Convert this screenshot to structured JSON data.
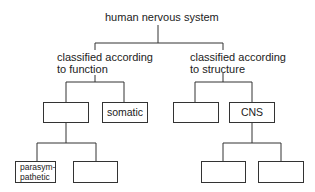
{
  "diagram": {
    "root": {
      "label": "human nervous system"
    },
    "branches": [
      {
        "label_line1": "classified according",
        "label_line2": "to function",
        "children": [
          {
            "label": "",
            "children": [
              {
                "label": "parasym-\npathetic"
              },
              {
                "label": ""
              }
            ]
          },
          {
            "label": "somatic"
          }
        ]
      },
      {
        "label_line1": "classified according",
        "label_line2": "to structure",
        "children": [
          {
            "label": ""
          },
          {
            "label": "CNS",
            "children": [
              {
                "label": ""
              },
              {
                "label": ""
              }
            ]
          }
        ]
      }
    ]
  }
}
